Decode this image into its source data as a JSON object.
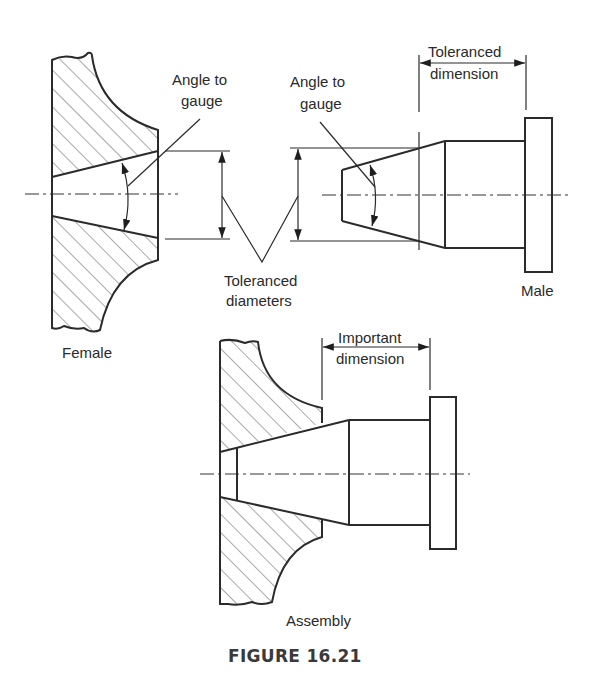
{
  "figure": {
    "caption": "FIGURE 16.21",
    "colors": {
      "line": "#2b2b2b",
      "text": "#2a2a2a",
      "background": "#ffffff"
    }
  },
  "labels": {
    "female_angle_line1": "Angle to",
    "female_angle_line2": "gauge",
    "male_angle_line1": "Angle to",
    "male_angle_line2": "gauge",
    "toleranced_diameters_line1": "Toleranced",
    "toleranced_diameters_line2": "diameters",
    "toleranced_dimension_line1": "Toleranced",
    "toleranced_dimension_line2": "dimension",
    "female": "Female",
    "male": "Male",
    "important_dimension_line1": "Important",
    "important_dimension_line2": "dimension",
    "assembly": "Assembly"
  },
  "parts": [
    {
      "name": "Female",
      "type": "tapered bore (hatched section)"
    },
    {
      "name": "Male",
      "type": "tapered plug with collar"
    },
    {
      "name": "Assembly",
      "type": "male plug seated in female bore"
    }
  ]
}
